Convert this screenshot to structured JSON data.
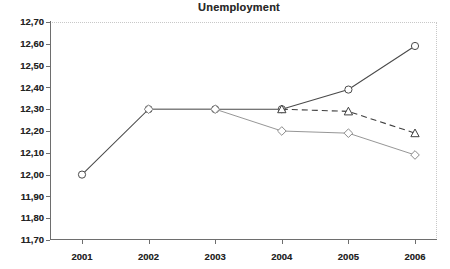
{
  "chart_data": {
    "type": "line",
    "title": "Unemployment",
    "xlabel": "",
    "ylabel": "",
    "categories": [
      "2001",
      "2002",
      "2003",
      "2004",
      "2005",
      "2006"
    ],
    "x": [
      2001,
      2002,
      2003,
      2004,
      2005,
      2006
    ],
    "ylim": [
      11.7,
      12.7
    ],
    "ytick_step": 0.1,
    "ytick_labels": [
      "12,70",
      "12,60",
      "12,50",
      "12,40",
      "12,30",
      "12,20",
      "12,10",
      "12,00",
      "11,90",
      "11,80",
      "11,70"
    ],
    "ytick_values": [
      12.7,
      12.6,
      12.5,
      12.4,
      12.3,
      12.2,
      12.1,
      12.0,
      11.9,
      11.8,
      11.7
    ],
    "decimal_separator": ",",
    "grid": false,
    "legend": false,
    "legend_position": "none",
    "background_color": "#ffffff",
    "axis_color": "#6e6e6e",
    "series": [
      {
        "name": "series-circle",
        "marker": "circle",
        "line_style": "solid",
        "color": "#4a4a4a",
        "x": [
          2001,
          2002,
          2003,
          2004,
          2005,
          2006
        ],
        "values": [
          12.0,
          12.3,
          12.3,
          12.3,
          12.39,
          12.59
        ]
      },
      {
        "name": "series-triangle",
        "marker": "triangle",
        "line_style": "dashed",
        "color": "#3f3f3f",
        "x": [
          2004,
          2005,
          2006
        ],
        "values": [
          12.3,
          12.29,
          12.19
        ]
      },
      {
        "name": "series-diamond",
        "marker": "diamond",
        "line_style": "solid",
        "color": "#8a8a8a",
        "x": [
          2002,
          2003,
          2004,
          2005,
          2006
        ],
        "values": [
          12.3,
          12.3,
          12.2,
          12.19,
          12.09
        ]
      }
    ]
  }
}
